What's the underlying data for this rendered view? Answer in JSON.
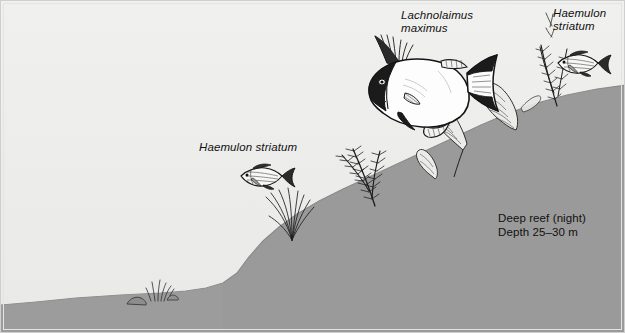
{
  "figure": {
    "background_color": "#ededea",
    "substrate_color": "#9a9a9a",
    "ink_color": "#1a1a1a"
  },
  "labels": {
    "hogfish": "Lachnolaimus\nmaximus",
    "grunt_right": "Haemulon\nstriatum",
    "grunt_middle": "Haemulon striatum"
  },
  "caption": {
    "text": "Deep reef (night)\nDepth 25–30 m",
    "habitat": "Deep reef (night)",
    "depth": "Depth 25–30 m"
  },
  "organisms": [
    {
      "name": "hogfish",
      "species": "Lachnolaimus maximus",
      "count": 1
    },
    {
      "name": "striped-grunt",
      "species": "Haemulon striatum",
      "count": 2
    }
  ],
  "features": [
    "sea-plume-gorgonian",
    "leafy-algae-blade",
    "seagrass-tuft",
    "rock",
    "sloping-reef-substrate"
  ]
}
